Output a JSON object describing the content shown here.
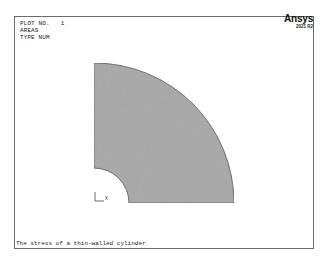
{
  "window": {
    "app": "Ansys Mechanical APDL graphics window",
    "logo_text": "Ansys",
    "version": "2021 R2"
  },
  "plot_header": {
    "lines": [
      "PLOT NO.   1",
      "AREAS",
      "TYPE NUM"
    ]
  },
  "plot": {
    "entity": "quarter annulus area",
    "fill_color": "#a0a0a0",
    "outline_color": "#555555",
    "origin_px": [
      94,
      203
    ],
    "inner_radius_px": 35,
    "outer_radius_px": 140
  },
  "triad": {
    "x_label": "X",
    "y_label": ""
  },
  "caption": "The stress of a thin-walled cylinder"
}
